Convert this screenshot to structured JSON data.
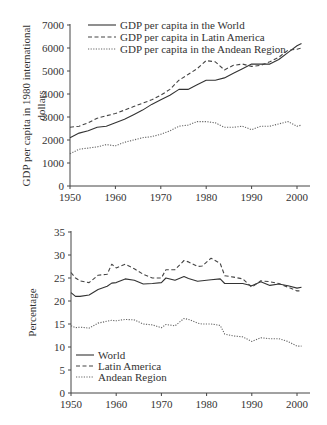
{
  "chart_data": [
    {
      "type": "line",
      "title": "",
      "xlabel": "",
      "ylabel": "GDP per capita in 1980 international dollars",
      "ylabel_lines": [
        "GDP per capita in 1980 international",
        "dollars"
      ],
      "xlim": [
        1950,
        2002
      ],
      "ylim": [
        0,
        7000
      ],
      "xticks": [
        1950,
        1960,
        1970,
        1980,
        1990,
        2000
      ],
      "yticks": [
        0,
        1000,
        2000,
        3000,
        4000,
        5000,
        6000,
        7000
      ],
      "grid": false,
      "legend_position": "top-left",
      "x": [
        1950,
        1952,
        1954,
        1956,
        1958,
        1960,
        1962,
        1964,
        1966,
        1968,
        1970,
        1972,
        1974,
        1976,
        1978,
        1980,
        1982,
        1984,
        1986,
        1988,
        1990,
        1992,
        1994,
        1996,
        1998,
        2000,
        2001
      ],
      "series": [
        {
          "name": "GDP per capita in the World",
          "style": "solid",
          "values": [
            2100,
            2300,
            2400,
            2550,
            2600,
            2750,
            2900,
            3100,
            3300,
            3550,
            3750,
            3950,
            4200,
            4200,
            4400,
            4600,
            4600,
            4700,
            4900,
            5100,
            5300,
            5300,
            5300,
            5500,
            5800,
            6100,
            6200
          ]
        },
        {
          "name": "GDP per capita in Latin America",
          "style": "dashed",
          "values": [
            2550,
            2600,
            2750,
            2950,
            3050,
            3150,
            3300,
            3450,
            3600,
            3750,
            3950,
            4200,
            4600,
            4850,
            5100,
            5450,
            5400,
            5050,
            5250,
            5300,
            5200,
            5250,
            5400,
            5600,
            5900,
            5950,
            6000
          ]
        },
        {
          "name": "GDP per capita in the Andean Region",
          "style": "dotted",
          "values": [
            1400,
            1600,
            1650,
            1700,
            1800,
            1750,
            1900,
            2000,
            2100,
            2150,
            2250,
            2400,
            2600,
            2650,
            2800,
            2800,
            2750,
            2550,
            2550,
            2600,
            2450,
            2600,
            2600,
            2700,
            2800,
            2600,
            2650
          ]
        }
      ]
    },
    {
      "type": "line",
      "title": "",
      "xlabel": "",
      "ylabel": "Percentage",
      "xlim": [
        1950,
        2002
      ],
      "ylim": [
        0,
        35
      ],
      "xticks": [
        1950,
        1960,
        1970,
        1980,
        1990,
        2000
      ],
      "yticks": [
        0,
        5,
        10,
        15,
        20,
        25,
        30,
        35
      ],
      "grid": false,
      "legend_position": "bottom-left",
      "x": [
        1950,
        1951,
        1952,
        1954,
        1956,
        1958,
        1959,
        1960,
        1962,
        1964,
        1966,
        1968,
        1970,
        1971,
        1973,
        1975,
        1976,
        1978,
        1979,
        1981,
        1983,
        1984,
        1986,
        1988,
        1990,
        1992,
        1994,
        1996,
        1998,
        2000,
        2001
      ],
      "series": [
        {
          "name": "World",
          "style": "solid",
          "values": [
            21.8,
            21.0,
            21.0,
            21.3,
            22.5,
            23.2,
            23.9,
            24.0,
            24.8,
            24.5,
            23.7,
            23.8,
            24.0,
            25.0,
            24.5,
            25.3,
            24.9,
            24.3,
            24.4,
            24.6,
            24.8,
            23.8,
            23.8,
            23.8,
            23.3,
            24.2,
            23.4,
            23.7,
            23.3,
            22.8,
            23.0
          ]
        },
        {
          "name": "Latin America",
          "style": "dashed",
          "values": [
            26.2,
            25.0,
            24.4,
            24.0,
            25.6,
            25.8,
            28.0,
            27.2,
            28.0,
            27.0,
            25.8,
            25.0,
            25.0,
            26.8,
            26.8,
            28.8,
            28.5,
            27.5,
            27.6,
            29.3,
            28.2,
            25.5,
            25.2,
            24.8,
            23.0,
            24.4,
            24.2,
            23.8,
            23.0,
            22.2,
            22.2
          ]
        },
        {
          "name": "Andean Region",
          "style": "dotted",
          "values": [
            14.6,
            14.2,
            14.3,
            14.1,
            15.2,
            15.6,
            15.8,
            15.7,
            16.0,
            15.9,
            15.0,
            14.8,
            14.2,
            14.9,
            14.6,
            16.2,
            16.0,
            15.2,
            15.0,
            15.0,
            14.7,
            12.8,
            12.4,
            12.2,
            11.2,
            12.0,
            11.8,
            11.8,
            11.2,
            10.2,
            10.2
          ]
        }
      ]
    }
  ]
}
